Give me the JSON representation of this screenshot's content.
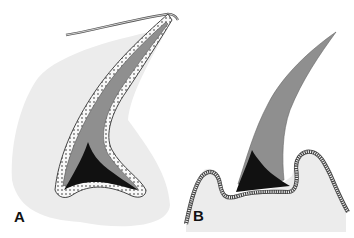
{
  "figure": {
    "panels": [
      {
        "id": "A",
        "label": "A",
        "description": "Curved elongated structure with lining epithelium enclosing a core, dark base region, embedded in surrounding tissue"
      },
      {
        "id": "B",
        "label": "B",
        "description": "Free-standing tapered curved structure emerging from a folded epithelial surface with a dark base region"
      }
    ],
    "colors": {
      "background": "#ffffff",
      "tissue": "#ececec",
      "core": "#8f8f8f",
      "base": "#111111",
      "epithelium_outline": "#444444",
      "epithelium_fill": "#f8f8f8"
    }
  }
}
